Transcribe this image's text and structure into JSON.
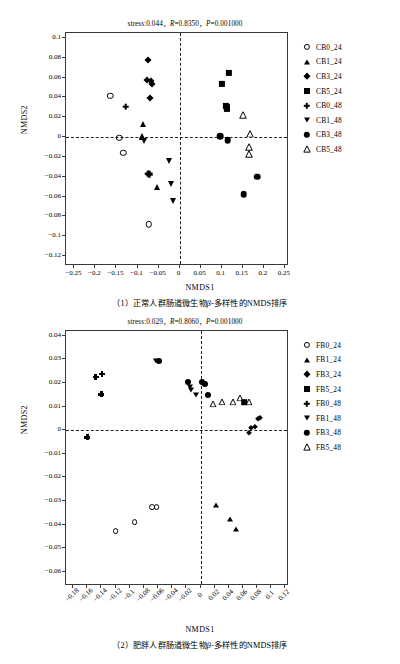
{
  "figure": {
    "panels": [
      {
        "id": "panel-1",
        "stats": "stress:0.044，R=0.8350，P=0.001000",
        "stats_parts": {
          "stress": "stress:0.044，",
          "R": "R=0.8350，",
          "P": "P=0.001000"
        },
        "xlabel": "NMDS1",
        "ylabel": "NMDS2",
        "caption": "（1）正常人群肠道微生物β-多样性的NMDS排序",
        "xticks": [
          "-0.25",
          "-0.2",
          "-0.15",
          "-0.1",
          "-0.05",
          "0",
          "0.05",
          "0.1",
          "0.15",
          "0.2",
          "0.25"
        ],
        "yticks": [
          "0.1",
          "0.08",
          "0.06",
          "0.04",
          "0.02",
          "0",
          "-0.02",
          "-0.04",
          "-0.06",
          "-0.08",
          "-0.1",
          "-0.12"
        ],
        "legend": [
          {
            "label": "CB0_24",
            "marker": "open-circle"
          },
          {
            "label": "CB1_24",
            "marker": "filled-triangle"
          },
          {
            "label": "CB3_24",
            "marker": "filled-diamond"
          },
          {
            "label": "CB5_24",
            "marker": "filled-square"
          },
          {
            "label": "CB0_48",
            "marker": "plus"
          },
          {
            "label": "CB1_48",
            "marker": "filled-triangle-down"
          },
          {
            "label": "CB3_48",
            "marker": "filled-circle"
          },
          {
            "label": "CB5_48",
            "marker": "open-triangle"
          }
        ]
      },
      {
        "id": "panel-2",
        "stats": "stress:0.029，R=0.8060，P=0.001000",
        "stats_parts": {
          "stress": "stress:0.029，",
          "R": "R=0.8060，",
          "P": "P=0.001000"
        },
        "xlabel": "NMDS1",
        "ylabel": "NMDS2",
        "caption": "（2）肥胖人群肠道微生物β-多样性的NMDS排序",
        "xticks": [
          "-0.18",
          "-0.16",
          "-0.14",
          "-0.12",
          "-0.1",
          "-0.08",
          "-0.06",
          "-0.04",
          "-0.02",
          "0",
          "0.02",
          "0.04",
          "0.06",
          "0.08",
          "0.1",
          "0.12"
        ],
        "yticks": [
          "0.04",
          "0.03",
          "0.02",
          "0.01",
          "0",
          "-0.01",
          "-0.02",
          "-0.03",
          "-0.04",
          "-0.05",
          "-0.06"
        ],
        "legend": [
          {
            "label": "FB0_24",
            "marker": "open-circle"
          },
          {
            "label": "FB1_24",
            "marker": "filled-triangle"
          },
          {
            "label": "FB3_24",
            "marker": "filled-diamond"
          },
          {
            "label": "FB5_24",
            "marker": "filled-square"
          },
          {
            "label": "FB0_48",
            "marker": "plus"
          },
          {
            "label": "FB1_48",
            "marker": "filled-triangle-down"
          },
          {
            "label": "FB3_48",
            "marker": "filled-circle"
          },
          {
            "label": "FB5_48",
            "marker": "open-triangle"
          }
        ]
      }
    ]
  },
  "chart_data": [
    {
      "type": "scatter",
      "title": "stress:0.044，R=0.8350，P=0.001000",
      "caption": "（1）正常人群肠道微生物β-多样性的NMDS排序",
      "xlabel": "NMDS1",
      "ylabel": "NMDS2",
      "xlim": [
        -0.27,
        0.26
      ],
      "ylim": [
        -0.13,
        0.105
      ],
      "grid": false,
      "legend_position": "right",
      "reference_lines": {
        "x": 0,
        "y": 0,
        "style": "dashed"
      },
      "series": [
        {
          "name": "CB0_24",
          "marker": "open-circle",
          "points": [
            [
              -0.165,
              0.0415
            ],
            [
              -0.143,
              -0.0005
            ],
            [
              -0.134,
              -0.0157
            ],
            [
              -0.073,
              -0.088
            ]
          ]
        },
        {
          "name": "CB1_24",
          "marker": "filled-triangle",
          "points": [
            [
              -0.088,
              0.013
            ],
            [
              -0.09,
              0.0015
            ],
            [
              -0.089,
              0.0005
            ],
            [
              -0.054,
              -0.0508
            ]
          ]
        },
        {
          "name": "CB3_24",
          "marker": "filled-diamond",
          "points": [
            [
              -0.074,
              0.0773
            ],
            [
              -0.077,
              0.0573
            ],
            [
              -0.069,
              0.0565
            ],
            [
              -0.066,
              0.0533
            ],
            [
              -0.07,
              0.0392
            ]
          ]
        },
        {
          "name": "CB5_24",
          "marker": "filled-square",
          "points": [
            [
              0.117,
              0.0645
            ],
            [
              0.101,
              0.0533
            ],
            [
              0.11,
              0.0315
            ],
            [
              0.113,
              0.03
            ],
            [
              0.112,
              0.0285
            ]
          ]
        },
        {
          "name": "CB0_48",
          "marker": "plus",
          "points": [
            [
              -0.128,
              0.0305
            ],
            [
              -0.074,
              -0.0368
            ],
            [
              -0.072,
              -0.0372
            ]
          ]
        },
        {
          "name": "CB1_48",
          "marker": "filled-triangle-down",
          "points": [
            [
              -0.085,
              -0.004
            ],
            [
              -0.026,
              -0.0245
            ],
            [
              -0.021,
              -0.0468
            ],
            [
              -0.016,
              -0.0648
            ]
          ]
        },
        {
          "name": "CB3_48",
          "marker": "filled-circle",
          "points": [
            [
              0.096,
              0.001
            ],
            [
              0.114,
              -0.0033
            ],
            [
              0.184,
              -0.04
            ],
            [
              0.152,
              -0.0575
            ]
          ]
        },
        {
          "name": "CB5_48",
          "marker": "open-triangle",
          "points": [
            [
              0.15,
              0.0288
            ],
            [
              0.167,
              0.0098
            ],
            [
              0.166,
              -0.0035
            ],
            [
              0.165,
              -0.0112
            ]
          ]
        }
      ]
    },
    {
      "type": "scatter",
      "title": "stress:0.029，R=0.8060，P=0.001000",
      "caption": "（2）肥胖人群肠道微生物β-多样性的NMDS排序",
      "xlabel": "NMDS1",
      "ylabel": "NMDS2",
      "xlim": [
        -0.19,
        0.125
      ],
      "ylim": [
        -0.066,
        0.042
      ],
      "grid": false,
      "legend_position": "right",
      "reference_lines": {
        "x": 0,
        "y": 0,
        "style": "dashed"
      },
      "series": [
        {
          "name": "FB0_24",
          "marker": "open-circle",
          "points": [
            [
              -0.12,
              -0.0428
            ],
            [
              -0.093,
              -0.0388
            ],
            [
              -0.068,
              -0.0325
            ],
            [
              -0.062,
              -0.0325
            ]
          ]
        },
        {
          "name": "FB1_24",
          "marker": "filled-triangle",
          "points": [
            [
              0.022,
              -0.0318
            ],
            [
              0.042,
              -0.0378
            ],
            [
              0.05,
              -0.0418
            ]
          ]
        },
        {
          "name": "FB3_24",
          "marker": "filled-diamond",
          "points": [
            [
              0.072,
              0.001
            ],
            [
              0.069,
              -0.001
            ],
            [
              0.077,
              0.0013
            ],
            [
              0.081,
              0.0048
            ],
            [
              0.084,
              0.0052
            ]
          ]
        },
        {
          "name": "FB5_24",
          "marker": "filled-square",
          "points": [
            [
              0.062,
              0.0118
            ]
          ]
        },
        {
          "name": "FB0_48",
          "marker": "plus",
          "points": [
            [
              -0.148,
              0.0225
            ],
            [
              -0.139,
              0.0237
            ],
            [
              -0.14,
              0.0152
            ],
            [
              -0.16,
              -0.003
            ]
          ]
        },
        {
          "name": "FB1_48",
          "marker": "filled-triangle-down",
          "points": [
            [
              -0.063,
              0.0295
            ],
            [
              -0.015,
              0.0182
            ],
            [
              -0.013,
              0.017
            ],
            [
              -0.006,
              0.0148
            ],
            [
              0.004,
              0.0195
            ]
          ]
        },
        {
          "name": "FB3_48",
          "marker": "filled-circle",
          "points": [
            [
              -0.058,
              0.0293
            ],
            [
              -0.018,
              0.0205
            ],
            [
              0.006,
              0.0195
            ],
            [
              0.01,
              0.0148
            ],
            [
              0.002,
              0.0205
            ]
          ]
        },
        {
          "name": "FB5_48",
          "marker": "open-triangle",
          "points": [
            [
              0.018,
              0.014
            ],
            [
              0.03,
              0.0148
            ],
            [
              0.046,
              0.0148
            ],
            [
              0.056,
              0.0165
            ],
            [
              0.068,
              0.0148
            ]
          ]
        }
      ]
    }
  ]
}
